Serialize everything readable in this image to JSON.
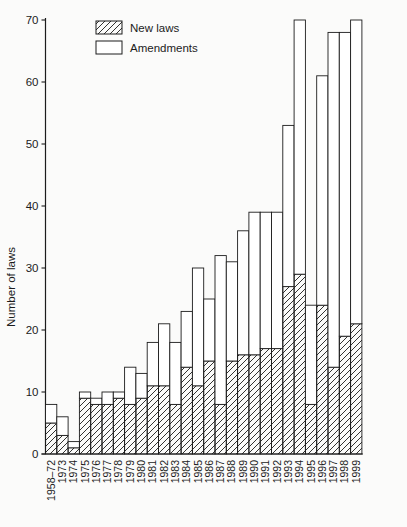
{
  "figure": {
    "background": "#fbfbfa",
    "ink": "#1c1c1c",
    "bar_fill": "#ffffff"
  },
  "chart_data": {
    "type": "bar",
    "stacked": true,
    "title": "",
    "xlabel": "",
    "ylabel": "Number of laws",
    "ylim": [
      0,
      70
    ],
    "yticks": [
      0,
      10,
      20,
      30,
      40,
      50,
      60,
      70
    ],
    "grid": false,
    "legend_position": "top-left-inside",
    "legend": [
      "New laws",
      "Amendments"
    ],
    "categories": [
      "1958–72",
      "1973",
      "1974",
      "1975",
      "1976",
      "1977",
      "1978",
      "1979",
      "1980",
      "1981",
      "1982",
      "1983",
      "1984",
      "1985",
      "1986",
      "1987",
      "1988",
      "1989",
      "1990",
      "1991",
      "1992",
      "1993",
      "1994",
      "1995",
      "1996",
      "1997",
      "1998",
      "1999"
    ],
    "series": [
      {
        "name": "New laws",
        "style": "hatched",
        "values": [
          5,
          3,
          1,
          9,
          8,
          8,
          9,
          8,
          9,
          11,
          11,
          8,
          14,
          11,
          15,
          8,
          15,
          16,
          16,
          17,
          17,
          27,
          29,
          8,
          24,
          14,
          19,
          21
        ]
      },
      {
        "name": "Amendments",
        "style": "open",
        "values": [
          3,
          3,
          1,
          1,
          1,
          2,
          1,
          6,
          4,
          7,
          10,
          10,
          9,
          19,
          10,
          24,
          16,
          20,
          23,
          22,
          22,
          26,
          41,
          16,
          37,
          54,
          49,
          49
        ]
      }
    ],
    "totals": [
      8,
      6,
      2,
      10,
      9,
      10,
      10,
      14,
      13,
      18,
      21,
      18,
      23,
      30,
      25,
      32,
      31,
      36,
      39,
      39,
      39,
      53,
      70,
      24,
      61,
      68,
      68,
      70
    ]
  }
}
